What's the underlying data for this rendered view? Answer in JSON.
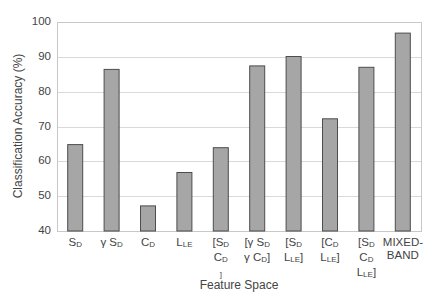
{
  "chart_data": {
    "type": "bar",
    "title": "",
    "xlabel": "Feature Space",
    "ylabel": "Classification Accuracy (%)",
    "ylim": [
      40,
      100
    ],
    "yticks": [
      40,
      50,
      60,
      70,
      80,
      90,
      100
    ],
    "grid": true,
    "legend": null,
    "categories": [
      "S_D",
      "γS_D",
      "C_D",
      "L_LE",
      "[S_D C_D]",
      "[γS_D γC_D]",
      "[S_D L_LE]",
      "[C_D L_LE]",
      "[S_D C_D L_LE]",
      "MIXED-BAND"
    ],
    "category_lines": [
      [
        [
          "S",
          "D"
        ]
      ],
      [
        [
          "γ S",
          "D"
        ]
      ],
      [
        [
          "C",
          "D"
        ]
      ],
      [
        [
          "L",
          "LE"
        ]
      ],
      [
        [
          "[S",
          "D"
        ],
        [
          "C",
          "D",
          ""
        ],
        " ]"
      ],
      [
        [
          "[γ S",
          "D"
        ],
        [
          "γ C",
          "D",
          "]"
        ]
      ],
      [
        [
          "[S",
          "D"
        ],
        [
          "L",
          "LE",
          "]"
        ]
      ],
      [
        [
          "[C",
          "D"
        ],
        [
          "L",
          "LE",
          "]"
        ]
      ],
      [
        [
          "[S",
          "D"
        ],
        [
          "C",
          "D"
        ],
        [
          "L",
          "LE",
          "]"
        ]
      ],
      [
        [
          "MIXED-",
          ""
        ],
        [
          "BAND",
          ""
        ]
      ]
    ],
    "values": [
      64.8,
      86.4,
      47.2,
      56.8,
      63.9,
      87.4,
      90.1,
      72.2,
      87.0,
      96.8
    ],
    "bar_color": "#a6a6a6",
    "bar_edge_color": "#4d4d4d",
    "grid_color": "#d9d9d9"
  }
}
